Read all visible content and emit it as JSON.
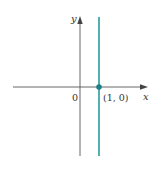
{
  "figure": {
    "axes": {
      "x_label": "x",
      "y_label": "y",
      "origin_label": "0"
    },
    "line": {
      "equation": "x = 1",
      "color": "#2a9d9a"
    },
    "point": {
      "label": "(1, 0)",
      "color": "#1f7f86"
    },
    "axis_color": "#555555"
  }
}
